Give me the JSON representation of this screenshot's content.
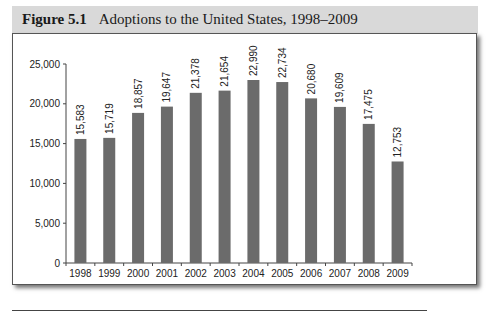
{
  "figure": {
    "number": "Figure 5.1",
    "caption": "Adoptions to the United States, 1998–2009"
  },
  "chart_data": {
    "type": "bar",
    "title": "Adoptions to the United States, 1998–2009",
    "xlabel": "",
    "ylabel": "",
    "categories": [
      "1998",
      "1999",
      "2000",
      "2001",
      "2002",
      "2003",
      "2004",
      "2005",
      "2006",
      "2007",
      "2008",
      "2009"
    ],
    "values": [
      15583,
      15719,
      18857,
      19647,
      21378,
      21654,
      22990,
      22734,
      20680,
      19609,
      17475,
      12753
    ],
    "value_labels": [
      "15,583",
      "15,719",
      "18,857",
      "19,647",
      "21,378",
      "21,654",
      "22,990",
      "22,734",
      "20,680",
      "19,609",
      "17,475",
      "12,753"
    ],
    "ylim": [
      0,
      25000
    ],
    "yticks": [
      0,
      5000,
      10000,
      15000,
      20000,
      25000
    ],
    "ytick_labels": [
      "0",
      "5,000",
      "10,000",
      "15,000",
      "20,000",
      "25,000"
    ],
    "grid": false,
    "legend": null,
    "bar_color": "#6b6b6b"
  }
}
